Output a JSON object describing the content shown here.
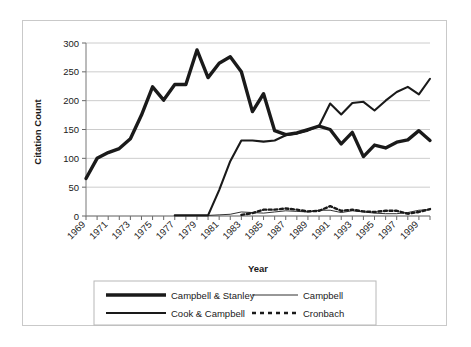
{
  "chart_data": {
    "type": "line",
    "title": "",
    "xlabel": "Year",
    "ylabel": "Citation Count",
    "xlim": [
      1969,
      2000
    ],
    "ylim": [
      0,
      300
    ],
    "ytick_values": [
      0,
      50,
      100,
      150,
      200,
      250,
      300
    ],
    "ytick_labels": [
      "0",
      "50",
      "100",
      "150",
      "200",
      "250",
      "300"
    ],
    "xtick_labels": [
      "1969",
      "1971",
      "1973",
      "1975",
      "1977",
      "1979",
      "1981",
      "1983",
      "1985",
      "1987",
      "1989",
      "1991",
      "1993",
      "1995",
      "1997",
      "1999"
    ],
    "grid": "horizontal",
    "legend_position": "bottom",
    "x": [
      1969,
      1970,
      1971,
      1972,
      1973,
      1974,
      1975,
      1976,
      1977,
      1978,
      1979,
      1980,
      1981,
      1982,
      1983,
      1984,
      1985,
      1986,
      1987,
      1988,
      1989,
      1990,
      1991,
      1992,
      1993,
      1994,
      1995,
      1996,
      1997,
      1998,
      1999,
      2000
    ],
    "series": [
      {
        "name": "Campbell & Stanley",
        "style": "thick-solid",
        "color": "#1a1a1a",
        "values": [
          65,
          100,
          110,
          117,
          134,
          175,
          224,
          201,
          228,
          228,
          288,
          240,
          265,
          276,
          250,
          181,
          212,
          148,
          141,
          144,
          150,
          156,
          150,
          125,
          145,
          103,
          123,
          118,
          128,
          132,
          148,
          131
        ]
      },
      {
        "name": "Cook & Campbell",
        "style": "medium-solid",
        "color": "#1a1a1a",
        "values": [
          null,
          null,
          null,
          null,
          null,
          null,
          null,
          null,
          1,
          1,
          1,
          1,
          45,
          95,
          131,
          131,
          129,
          131,
          140,
          143,
          148,
          156,
          195,
          176,
          196,
          198,
          183,
          200,
          215,
          224,
          211,
          238
        ]
      },
      {
        "name": "Campbell",
        "style": "thin-solid",
        "color": "#1a1a1a",
        "values": [
          null,
          null,
          null,
          null,
          null,
          null,
          null,
          null,
          1,
          1,
          1,
          1,
          2,
          3,
          7,
          6,
          5,
          7,
          9,
          8,
          7,
          10,
          10,
          6,
          9,
          7,
          5,
          4,
          4,
          6,
          10,
          11
        ]
      },
      {
        "name": "Cronbach",
        "style": "dashed",
        "color": "#1a1a1a",
        "values": [
          null,
          null,
          null,
          null,
          null,
          null,
          null,
          null,
          null,
          null,
          null,
          null,
          null,
          null,
          2,
          5,
          11,
          11,
          13,
          11,
          8,
          9,
          17,
          9,
          11,
          8,
          7,
          9,
          9,
          4,
          7,
          12
        ]
      }
    ]
  },
  "legend": {
    "entries": [
      {
        "label": "Campbell & Stanley",
        "style": "thick-solid"
      },
      {
        "label": "Campbell",
        "style": "thin-solid"
      },
      {
        "label": "Cook & Campbell",
        "style": "medium-solid"
      },
      {
        "label": "Cronbach",
        "style": "dashed"
      }
    ]
  }
}
